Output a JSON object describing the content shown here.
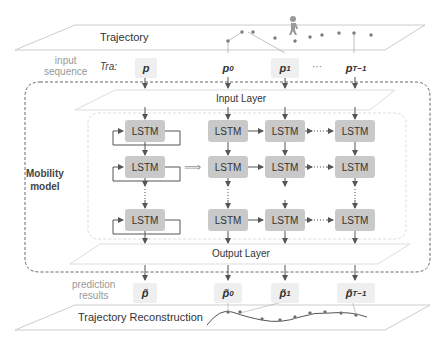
{
  "trajectory": {
    "title": "Trajectory"
  },
  "input": {
    "side_label_line1": "input",
    "side_label_line2": "sequence",
    "prefix": "Tra:",
    "points": [
      {
        "base": "p",
        "sub": ""
      },
      {
        "base": "p",
        "sub": "0"
      },
      {
        "base": "p",
        "sub": "1"
      },
      {
        "base": "p",
        "sub": "T−1"
      }
    ],
    "ellipsis": "···"
  },
  "model": {
    "label_line1": "Mobility",
    "label_line2": "model",
    "input_layer": "Input Layer",
    "output_layer": "Output Layer",
    "cell_label": "LSTM",
    "unroll_arrow": "⟹"
  },
  "output": {
    "side_label_line1": "prediction",
    "side_label_line2": "results",
    "points": [
      {
        "base": "p̃",
        "sub": ""
      },
      {
        "base": "p̃",
        "sub": "0"
      },
      {
        "base": "p̃",
        "sub": "1"
      },
      {
        "base": "p̃",
        "sub": "T−1"
      }
    ]
  },
  "reconstruction": {
    "title": "Trajectory Reconstruction"
  },
  "colors": {
    "lstm_fill": "#c9c9c9",
    "line": "#555555",
    "plane_border": "#cccccc",
    "pbox_fill": "#efefef"
  }
}
